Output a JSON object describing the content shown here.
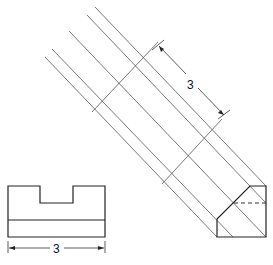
{
  "diagram": {
    "type": "technical-drawing-auxiliary-view",
    "front_view": {
      "dimension_label": "3"
    },
    "auxiliary_view": {
      "dimension_label": "3"
    },
    "colors": {
      "line": "#222222",
      "background": "#ffffff"
    }
  }
}
